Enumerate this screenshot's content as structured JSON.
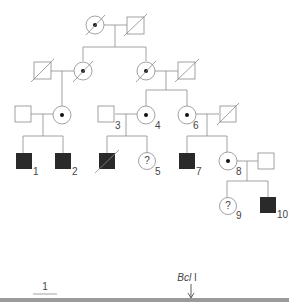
{
  "figure": {
    "type": "pedigree",
    "colors": {
      "line": "#8a8a8a",
      "affected": "#2a2a2a",
      "dot": "#111111",
      "bar": "#9a9a9a"
    },
    "individuals": [
      {
        "id": "I-1",
        "sex": "female",
        "status": "carrier",
        "deceased": true,
        "label": ""
      },
      {
        "id": "I-2",
        "sex": "male",
        "status": "unaffected",
        "deceased": true,
        "label": ""
      },
      {
        "id": "II-1",
        "sex": "male",
        "status": "unaffected",
        "deceased": true,
        "label": ""
      },
      {
        "id": "II-2",
        "sex": "female",
        "status": "carrier",
        "deceased": true,
        "label": ""
      },
      {
        "id": "II-3",
        "sex": "female",
        "status": "carrier",
        "deceased": true,
        "label": ""
      },
      {
        "id": "II-4",
        "sex": "male",
        "status": "unaffected",
        "deceased": true,
        "label": ""
      },
      {
        "id": "III-1",
        "sex": "male",
        "status": "unaffected",
        "deceased": false,
        "label": ""
      },
      {
        "id": "III-2",
        "sex": "female",
        "status": "carrier",
        "deceased": false,
        "label": ""
      },
      {
        "id": "III-3",
        "sex": "male",
        "status": "unaffected",
        "deceased": false,
        "label": "3"
      },
      {
        "id": "III-4",
        "sex": "female",
        "status": "carrier",
        "deceased": false,
        "label": "4"
      },
      {
        "id": "III-5",
        "sex": "female",
        "status": "carrier",
        "deceased": false,
        "label": "6"
      },
      {
        "id": "III-6",
        "sex": "male",
        "status": "unaffected",
        "deceased": true,
        "label": ""
      },
      {
        "id": "IV-1",
        "sex": "male",
        "status": "affected",
        "deceased": false,
        "label": "1"
      },
      {
        "id": "IV-2",
        "sex": "male",
        "status": "affected",
        "deceased": false,
        "label": "2"
      },
      {
        "id": "IV-3",
        "sex": "male",
        "status": "affected",
        "deceased": true,
        "label": ""
      },
      {
        "id": "IV-4",
        "sex": "female",
        "status": "unknown",
        "symbol_text": "?",
        "deceased": false,
        "label": "5"
      },
      {
        "id": "IV-5",
        "sex": "male",
        "status": "affected",
        "deceased": false,
        "label": "7"
      },
      {
        "id": "IV-6",
        "sex": "female",
        "status": "carrier",
        "deceased": false,
        "label": "8"
      },
      {
        "id": "IV-7",
        "sex": "male",
        "status": "unaffected",
        "deceased": false,
        "label": ""
      },
      {
        "id": "V-1",
        "sex": "female",
        "status": "unknown",
        "symbol_text": "?",
        "deceased": false,
        "label": "9"
      },
      {
        "id": "V-2",
        "sex": "male",
        "status": "affected",
        "deceased": false,
        "label": "10"
      }
    ],
    "labels": {
      "n1": "1",
      "n2": "2",
      "n3": "3",
      "n4": "4",
      "n5": "5",
      "n6": "6",
      "n7": "7",
      "n8": "8",
      "n9": "9",
      "n10": "10",
      "unknown_mark": "?"
    },
    "map": {
      "scale_label": "1",
      "site_label": "Bcl",
      "site_label_suffix": " I"
    }
  }
}
